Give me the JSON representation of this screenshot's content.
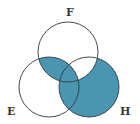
{
  "diagram": {
    "type": "venn",
    "sets": [
      {
        "id": "F",
        "label": "F",
        "cx": 68,
        "cy": 52,
        "r": 30
      },
      {
        "id": "E",
        "label": "E",
        "cx": 49,
        "cy": 87,
        "r": 30
      },
      {
        "id": "H",
        "label": "H",
        "cx": 89,
        "cy": 87,
        "r": 30
      }
    ],
    "shaded_regions": [
      "F∩E only",
      "F∩E∩H",
      "E∩H only",
      "H only"
    ],
    "unshaded_regions": [
      "F only",
      "E only",
      "F∩H only"
    ],
    "colors": {
      "fill": "#4a96b0",
      "stroke": "#2c3a42",
      "background": "#ffffff"
    }
  }
}
